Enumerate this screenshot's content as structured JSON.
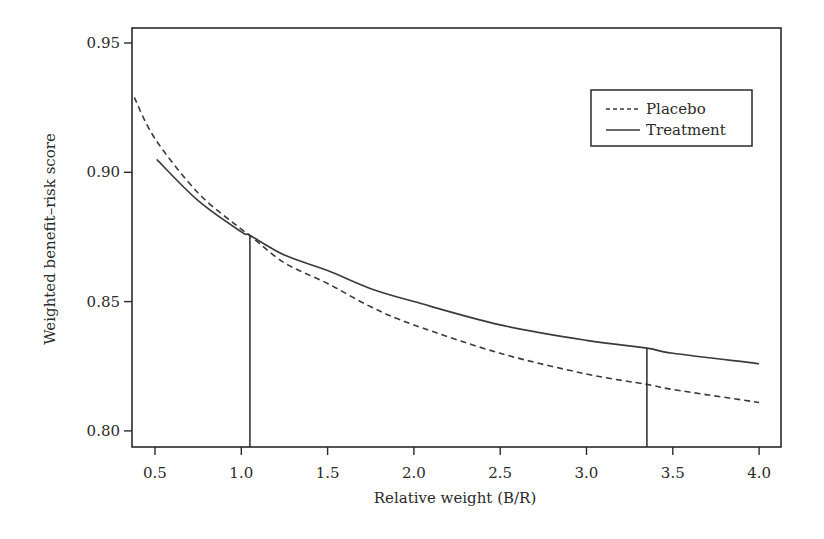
{
  "chart_data": {
    "type": "line",
    "title": "",
    "xlabel": "Relative weight (B/R)",
    "ylabel": "Weighted benefit–risk score",
    "xlim": [
      0.38,
      4.14
    ],
    "ylim": [
      0.793,
      0.956
    ],
    "x_ticks": [
      0.5,
      1.0,
      1.5,
      2.0,
      2.5,
      3.0,
      3.5,
      4.0
    ],
    "x_tick_labels": [
      "0.5",
      "1.0",
      "1.5",
      "2.0",
      "2.5",
      "3.0",
      "3.5",
      "4.0"
    ],
    "y_ticks": [
      0.8,
      0.85,
      0.9,
      0.95
    ],
    "y_tick_labels": [
      "0.80",
      "0.85",
      "0.90",
      "0.95"
    ],
    "grid": false,
    "legend_position": "upper right",
    "series": [
      {
        "name": "Placebo",
        "style": "dashed",
        "x": [
          0.38,
          0.5,
          0.75,
          1.0,
          1.05,
          1.25,
          1.5,
          1.75,
          2.0,
          2.5,
          3.0,
          3.35,
          3.5,
          4.0
        ],
        "y": [
          0.929,
          0.913,
          0.892,
          0.878,
          0.8756,
          0.865,
          0.857,
          0.848,
          0.841,
          0.83,
          0.822,
          0.818,
          0.816,
          0.811
        ]
      },
      {
        "name": "Treatment",
        "style": "solid",
        "x": [
          0.51,
          0.75,
          1.0,
          1.05,
          1.25,
          1.5,
          1.75,
          2.0,
          2.5,
          3.0,
          3.35,
          3.5,
          4.0
        ],
        "y": [
          0.905,
          0.889,
          0.877,
          0.8756,
          0.868,
          0.862,
          0.855,
          0.85,
          0.841,
          0.835,
          0.832,
          0.83,
          0.826
        ]
      }
    ],
    "annotations": [
      {
        "type": "vline",
        "x": 1.05,
        "y_from": 0.793,
        "y_to": 0.8756,
        "note": "curves cross"
      },
      {
        "type": "vline",
        "x": 3.35,
        "y_from": 0.793,
        "y_to": 0.832
      }
    ]
  },
  "legend": {
    "items": [
      {
        "label": "Placebo",
        "style": "dashed"
      },
      {
        "label": "Treatment",
        "style": "solid"
      }
    ]
  },
  "colors": {
    "line": "#3a3a3a",
    "axis": "#2a2a2a",
    "background": "#ffffff"
  }
}
